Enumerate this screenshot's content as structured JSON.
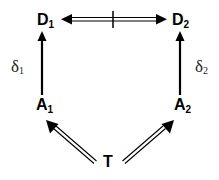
{
  "nodes": {
    "D1": {
      "main": "D",
      "sub": "1"
    },
    "D2": {
      "main": "D",
      "sub": "2"
    },
    "A1": {
      "main": "A",
      "sub": "1"
    },
    "A2": {
      "main": "A",
      "sub": "2"
    },
    "T": {
      "main": "T"
    }
  },
  "edge_labels": {
    "delta1": {
      "main": "δ",
      "sub": "1"
    },
    "delta2": {
      "main": "δ",
      "sub": "2"
    }
  },
  "edges": [
    {
      "from": "D1",
      "to": "D2",
      "style": "double-headed double-line with tick (not equivalent)"
    },
    {
      "from": "A1",
      "to": "D1",
      "style": "solid arrow",
      "label": "δ1"
    },
    {
      "from": "A2",
      "to": "D2",
      "style": "solid arrow",
      "label": "δ2"
    },
    {
      "from": "T",
      "to": "A1",
      "style": "double-line arrow"
    },
    {
      "from": "T",
      "to": "A2",
      "style": "double-line arrow"
    }
  ],
  "colors": {
    "stroke": "#000000",
    "background": "#ffffff"
  }
}
